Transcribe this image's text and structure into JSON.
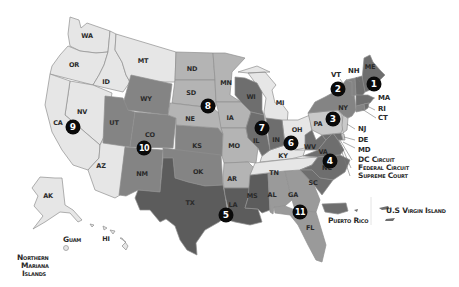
{
  "map": {
    "title": "U.S. Federal Judicial Circuits",
    "colors": {
      "very_light": "#e6e6e6",
      "light": "#c9c9c9",
      "mid_light": "#b4b4b4",
      "mid": "#9a9a9a",
      "mid_dark": "#848484",
      "dark": "#6e6e6e",
      "darkest": "#5c5c5c",
      "border": "#8f8f8f",
      "badge": "#0a0a0a",
      "text": "#2a2a2a"
    },
    "circuits": [
      {
        "number": "1",
        "states": [
          "ME",
          "NH",
          "MA",
          "RI"
        ],
        "shade": "dark"
      },
      {
        "number": "2",
        "states": [
          "VT",
          "NY",
          "CT"
        ],
        "shade": "mid_dark"
      },
      {
        "number": "3",
        "states": [
          "PA",
          "NJ",
          "DE"
        ],
        "shade": "light"
      },
      {
        "number": "4",
        "states": [
          "MD",
          "WV",
          "VA",
          "NC",
          "SC"
        ],
        "shade": "dark"
      },
      {
        "number": "5",
        "states": [
          "TX",
          "LA",
          "MS"
        ],
        "shade": "darkest"
      },
      {
        "number": "6",
        "states": [
          "MI",
          "OH",
          "KY",
          "TN"
        ],
        "shade": "very_light"
      },
      {
        "number": "7",
        "states": [
          "WI",
          "IL",
          "IN"
        ],
        "shade": "dark"
      },
      {
        "number": "8",
        "states": [
          "ND",
          "SD",
          "NE",
          "MN",
          "IA",
          "MO",
          "AR"
        ],
        "shade": "mid_light"
      },
      {
        "number": "9",
        "states": [
          "WA",
          "OR",
          "CA",
          "NV",
          "ID",
          "MT",
          "AZ",
          "AK",
          "HI",
          "GUAM",
          "NORTHERN MARIANA ISLANDS"
        ],
        "shade": "very_light"
      },
      {
        "number": "10",
        "states": [
          "WY",
          "UT",
          "CO",
          "KS",
          "NM",
          "OK"
        ],
        "shade": "mid_dark"
      },
      {
        "number": "11",
        "states": [
          "AL",
          "GA",
          "FL"
        ],
        "shade": "mid"
      }
    ],
    "state_labels": {
      "WA": "WA",
      "OR": "OR",
      "ID": "ID",
      "MT": "MT",
      "WY": "WY",
      "ND": "ND",
      "SD": "SD",
      "MN": "MN",
      "NE": "NE",
      "IA": "IA",
      "NV": "NV",
      "CA": "CA",
      "UT": "UT",
      "CO": "CO",
      "KS": "KS",
      "MO": "MO",
      "AZ": "AZ",
      "NM": "NM",
      "OK": "OK",
      "AR": "AR",
      "TX": "TX",
      "LA": "LA",
      "MS": "MS",
      "AL": "AL",
      "GA": "GA",
      "FL": "FL",
      "TN": "TN",
      "KY": "KY",
      "IL": "IL",
      "IN": "IN",
      "OH": "OH",
      "WI": "WI",
      "MI": "MI",
      "WV": "WV",
      "VA": "VA",
      "NC": "NC",
      "SC": "SC",
      "PA": "PA",
      "NY": "NY",
      "VT": "VT",
      "NH": "NH",
      "ME": "ME",
      "MA": "MA",
      "RI": "RI",
      "CT": "CT",
      "NJ": "NJ",
      "DE": "DE",
      "MD": "MD",
      "AK": "AK",
      "HI": "HI"
    },
    "territory_labels": {
      "guam": "Guam",
      "nmi_line1": "Northern",
      "nmi_line2": "Mariana",
      "nmi_line3": "Islands",
      "puerto_rico": "Puerto Rico",
      "usvi": "U.S Virgin Island"
    },
    "dc_labels": {
      "dc_circuit": "DC Circuit",
      "federal_circuit": "Federal Circuit",
      "supreme_court": "Supreme Court"
    }
  }
}
